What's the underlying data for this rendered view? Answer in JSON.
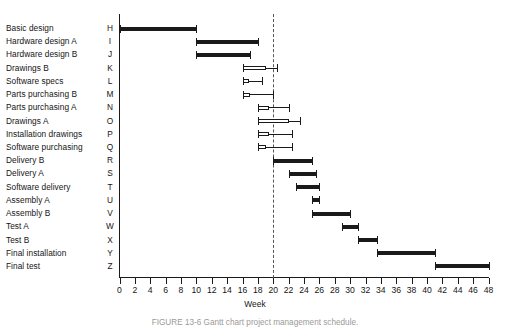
{
  "figure": {
    "caption": "FIGURE 13-6   Gantt chart project management schedule."
  },
  "axis": {
    "title": "Week",
    "ticks": [
      0,
      2,
      4,
      6,
      8,
      10,
      12,
      14,
      16,
      18,
      20,
      22,
      24,
      26,
      28,
      30,
      32,
      34,
      36,
      38,
      40,
      42,
      44,
      46,
      48
    ],
    "min": 0,
    "max": 48,
    "step": 2
  },
  "status_marker": {
    "label": "",
    "week": 20,
    "style": "dashed"
  },
  "chart_data": {
    "type": "bar",
    "orientation": "horizontal",
    "title": "",
    "xlabel": "Week",
    "ylabel": "",
    "xlim": [
      0,
      48
    ],
    "grid": false,
    "legend": "",
    "categories": [
      "Basic design",
      "Hardware design A",
      "Hardware design B",
      "Drawings B",
      "Software specs",
      "Parts purchasing B",
      "Parts purchasing A",
      "Drawings A",
      "Installation drawings",
      "Software purchasing",
      "Delivery B",
      "Delivery A",
      "Software delivery",
      "Assembly A",
      "Assembly B",
      "Test A",
      "Test B",
      "Final installation",
      "Final test"
    ],
    "codes": [
      "H",
      "I",
      "J",
      "K",
      "L",
      "M",
      "N",
      "O",
      "P",
      "Q",
      "R",
      "S",
      "T",
      "U",
      "V",
      "W",
      "X",
      "Y",
      "Z"
    ],
    "tasks": [
      {
        "code": "H",
        "label": "Basic design",
        "start": 0,
        "end": 10,
        "float_end": 10,
        "open": false
      },
      {
        "code": "I",
        "label": "Hardware design A",
        "start": 10,
        "end": 18,
        "float_end": 18,
        "open": false
      },
      {
        "code": "J",
        "label": "Hardware design B",
        "start": 10,
        "end": 17,
        "float_end": 17,
        "open": false
      },
      {
        "code": "K",
        "label": "Drawings B",
        "start": 16,
        "end": 19,
        "float_end": 20.5,
        "open": true
      },
      {
        "code": "L",
        "label": "Software specs",
        "start": 16,
        "end": 16.8,
        "float_end": 18.5,
        "open": true
      },
      {
        "code": "M",
        "label": "Parts purchasing B",
        "start": 16,
        "end": 17,
        "float_end": 20,
        "open": true
      },
      {
        "code": "N",
        "label": "Parts purchasing A",
        "start": 18,
        "end": 19.5,
        "float_end": 22,
        "open": true
      },
      {
        "code": "O",
        "label": "Drawings A",
        "start": 18,
        "end": 22,
        "float_end": 23.5,
        "open": true
      },
      {
        "code": "P",
        "label": "Installation drawings",
        "start": 18,
        "end": 19.5,
        "float_end": 22.5,
        "open": true
      },
      {
        "code": "Q",
        "label": "Software purchasing",
        "start": 18,
        "end": 19,
        "float_end": 22.5,
        "open": true
      },
      {
        "code": "R",
        "label": "Delivery B",
        "start": 20,
        "end": 25,
        "float_end": 25,
        "open": false
      },
      {
        "code": "S",
        "label": "Delivery A",
        "start": 22,
        "end": 25.5,
        "float_end": 25.5,
        "open": false
      },
      {
        "code": "T",
        "label": "Software delivery",
        "start": 23,
        "end": 26,
        "float_end": 26,
        "open": false
      },
      {
        "code": "U",
        "label": "Assembly A",
        "start": 25,
        "end": 26,
        "float_end": 26,
        "open": false
      },
      {
        "code": "V",
        "label": "Assembly B",
        "start": 25,
        "end": 30,
        "float_end": 30,
        "open": false
      },
      {
        "code": "W",
        "label": "Test A",
        "start": 29,
        "end": 31,
        "float_end": 31,
        "open": false
      },
      {
        "code": "X",
        "label": "Test B",
        "start": 31,
        "end": 33.5,
        "float_end": 33.5,
        "open": false
      },
      {
        "code": "Y",
        "label": "Final installation",
        "start": 33.5,
        "end": 41,
        "float_end": 41,
        "open": false
      },
      {
        "code": "Z",
        "label": "Final test",
        "start": 41,
        "end": 48,
        "float_end": 48,
        "open": false
      }
    ]
  }
}
